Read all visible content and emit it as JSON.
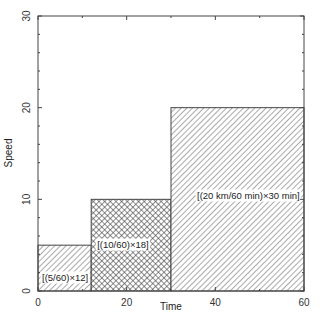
{
  "chart_data": {
    "type": "bar",
    "title": "",
    "xlabel": "Time",
    "ylabel": "Speed",
    "xlim": [
      0,
      60
    ],
    "ylim": [
      0,
      30
    ],
    "xticks": [
      0,
      20,
      40,
      60
    ],
    "yticks": [
      0,
      10,
      20,
      30
    ],
    "grid": false,
    "bars": [
      {
        "x_start": 0,
        "x_end": 12,
        "height": 5,
        "pattern": "diagonal-hatch",
        "label": "[(5/60)×12]"
      },
      {
        "x_start": 12,
        "x_end": 30,
        "height": 10,
        "pattern": "crosshatch",
        "label": "[(10/60)×18]"
      },
      {
        "x_start": 30,
        "x_end": 60,
        "height": 20,
        "pattern": "diagonal-hatch",
        "label": "[(20 km/60 min)×30 min]"
      }
    ]
  },
  "axes": {
    "x_label": "Time",
    "y_label": "Speed",
    "x_ticks": [
      "0",
      "20",
      "40",
      "60"
    ],
    "y_ticks": [
      "0",
      "10",
      "20",
      "30"
    ]
  },
  "colors": {
    "line": "#444444",
    "hatch": "#555555",
    "background": "#ffffff"
  }
}
